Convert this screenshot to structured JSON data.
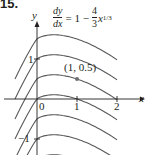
{
  "problem_number": "15.",
  "equation": {
    "lhs_num": "dy",
    "lhs_den": "dx",
    "equals": "= 1 −",
    "coef_num": "4",
    "coef_den": "3",
    "var": "x",
    "exponent": "1/3"
  },
  "axes": {
    "x_label": "x",
    "y_label": "y",
    "x_ticks": [
      {
        "value": 0,
        "label": "0"
      },
      {
        "value": 1,
        "label": "1"
      },
      {
        "value": 2,
        "label": "2"
      }
    ],
    "y_ticks": [
      {
        "value": 1,
        "label": "1"
      },
      {
        "value": -1,
        "label": "−1"
      }
    ]
  },
  "point": {
    "x": 1,
    "y": 0.5,
    "label": "(1, 0.5)"
  },
  "colors": {
    "curve": "#58595b",
    "axis": "#231f20",
    "point": "#6d6e71"
  },
  "chart_data": {
    "type": "line",
    "xlabel": "x",
    "ylabel": "y",
    "xlim": [
      -0.8,
      2.6
    ],
    "ylim": [
      -1.4,
      2.4
    ],
    "grid": false,
    "family": "y = x − x^(4/3) + C",
    "series": [
      {
        "name": "C=1.5",
        "C": 1.5
      },
      {
        "name": "C=1.0",
        "C": 1.0
      },
      {
        "name": "C=0.5 (through (1, 0.5))",
        "C": 0.5
      },
      {
        "name": "C=0",
        "C": 0
      },
      {
        "name": "C=-0.5",
        "C": -0.5
      },
      {
        "name": "C=-1.0",
        "C": -1.0
      },
      {
        "name": "C=-1.5",
        "C": -1.5
      }
    ],
    "x_range_drawn": [
      -0.55,
      2.0
    ],
    "annotations": [
      {
        "x": 1,
        "y": 0.5,
        "text": "(1, 0.5)"
      }
    ]
  }
}
